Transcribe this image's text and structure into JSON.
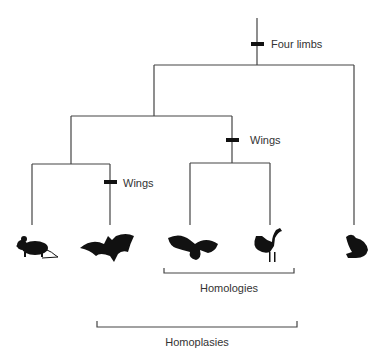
{
  "tree": {
    "characters": [
      {
        "label": "Four limbs"
      },
      {
        "label": "Wings"
      },
      {
        "label": "Wings"
      }
    ],
    "taxa": [
      {
        "name": "mouse",
        "icon": "mouse-icon"
      },
      {
        "name": "bat",
        "icon": "bat-icon"
      },
      {
        "name": "eagle",
        "icon": "eagle-icon"
      },
      {
        "name": "rooster",
        "icon": "rooster-icon"
      },
      {
        "name": "frog",
        "icon": "frog-icon"
      }
    ]
  },
  "brackets": {
    "homologies": "Homologies",
    "homoplasies": "Homoplasies"
  },
  "colors": {
    "line": "#444444",
    "silhouette": "#111111"
  }
}
